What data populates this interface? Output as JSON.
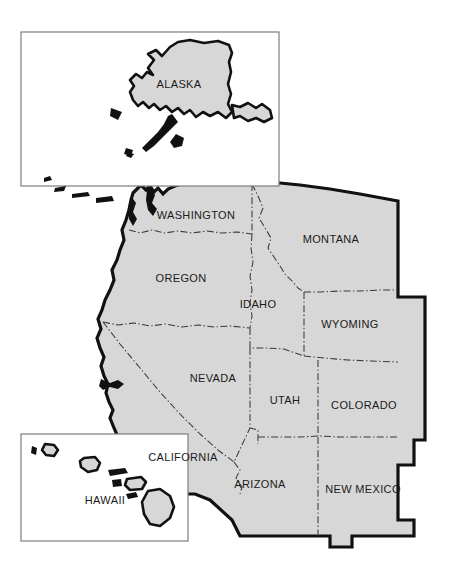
{
  "map": {
    "title": "Western United States Map",
    "background_color": "#ffffff",
    "state_fill_color": "#d7d7d7",
    "outer_border_color": "#111111",
    "inner_border_color": "#3a3a3a",
    "inset_border_color": "#7d7d7d",
    "label_color": "#1a1a1a",
    "mainland_states": [
      {
        "name": "WASHINGTON",
        "label_x": 196,
        "label_y": 216
      },
      {
        "name": "OREGON",
        "label_x": 181,
        "label_y": 279
      },
      {
        "name": "IDAHO",
        "label_x": 258,
        "label_y": 305
      },
      {
        "name": "MONTANA",
        "label_x": 331,
        "label_y": 240
      },
      {
        "name": "WYOMING",
        "label_x": 350,
        "label_y": 325
      },
      {
        "name": "NEVADA",
        "label_x": 213,
        "label_y": 379
      },
      {
        "name": "UTAH",
        "label_x": 285,
        "label_y": 401
      },
      {
        "name": "COLORADO",
        "label_x": 364,
        "label_y": 406
      },
      {
        "name": "CALIFORNIA",
        "label_x": 183,
        "label_y": 458
      },
      {
        "name": "ARIZONA",
        "label_x": 260,
        "label_y": 485
      },
      {
        "name": "NEW MEXICO",
        "label_x": 363,
        "label_y": 490
      }
    ],
    "insets": [
      {
        "name": "ALASKA",
        "label_x": 179,
        "label_y": 85,
        "box_x": 21,
        "box_y": 32,
        "box_w": 258,
        "box_h": 154
      },
      {
        "name": "HAWAII",
        "label_x": 105,
        "label_y": 501,
        "box_x": 21,
        "box_y": 434,
        "box_w": 167,
        "box_h": 107
      }
    ]
  }
}
